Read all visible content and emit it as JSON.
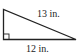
{
  "figure": {
    "type": "right-triangle",
    "hypotenuse_label": "13 in.",
    "base_label": "12 in.",
    "right_angle_marker": true,
    "stroke_color": "#222222"
  }
}
